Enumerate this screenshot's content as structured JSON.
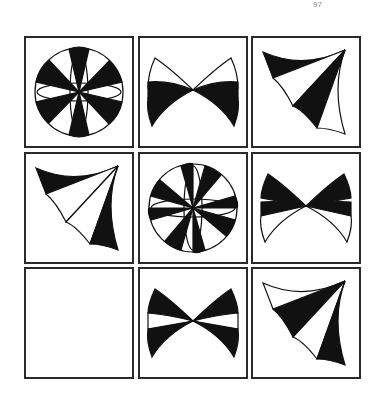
{
  "top_fragment": "97",
  "puzzle": {
    "type": "3x3 matrix reasoning",
    "rows": 3,
    "cols": 3,
    "cells": [
      {
        "row": 1,
        "col": 1,
        "figure": "rosette",
        "label": "pinwheel rosette"
      },
      {
        "row": 1,
        "col": 2,
        "figure": "bowtie-a",
        "label": "mirrored fans, black outer"
      },
      {
        "row": 1,
        "col": 3,
        "figure": "fan-a",
        "label": "triangular fan, black top"
      },
      {
        "row": 2,
        "col": 1,
        "figure": "fan-b",
        "label": "triangular fan, black top and right"
      },
      {
        "row": 2,
        "col": 2,
        "figure": "rosette",
        "label": "pinwheel rosette"
      },
      {
        "row": 2,
        "col": 3,
        "figure": "bowtie-b",
        "label": "mirrored fans, black middle"
      },
      {
        "row": 3,
        "col": 1,
        "figure": "empty",
        "label": "missing answer"
      },
      {
        "row": 3,
        "col": 2,
        "figure": "bowtie-c",
        "label": "mirrored fans, black upper and lower"
      },
      {
        "row": 3,
        "col": 3,
        "figure": "fan-c",
        "label": "triangular fan, black middle and right"
      }
    ]
  },
  "colors": {
    "ink": "#111111",
    "border": "#2a2a2a",
    "background": "#ffffff"
  }
}
